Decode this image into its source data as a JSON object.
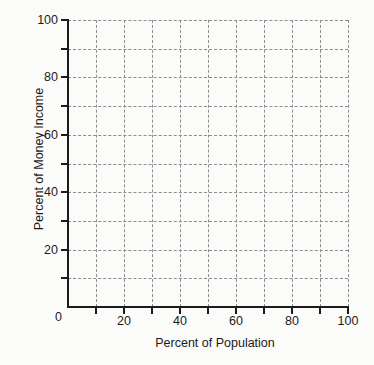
{
  "chart_data": {
    "type": "line",
    "title": "",
    "subtitle": "",
    "xlabel": "Percent of Population",
    "ylabel": "Percent of Money Income",
    "xlim": [
      0,
      100
    ],
    "ylim": [
      0,
      100
    ],
    "xticks": [
      0,
      10,
      20,
      30,
      40,
      50,
      60,
      70,
      80,
      90,
      100
    ],
    "yticks": [
      0,
      10,
      20,
      30,
      40,
      50,
      60,
      70,
      80,
      90,
      100
    ],
    "xticklabels": [
      "0",
      "",
      "20",
      "",
      "40",
      "",
      "60",
      "",
      "80",
      "",
      "100"
    ],
    "yticklabels": [
      "0",
      "",
      "20",
      "",
      "40",
      "",
      "60",
      "",
      "80",
      "",
      "100"
    ],
    "grid": true,
    "grid_style": "dashed",
    "grid_color": "#8d8d8d",
    "grid_spacing": 10,
    "legend": false,
    "legend_position": "none",
    "series": [],
    "values": [],
    "categories": [],
    "annotations": [],
    "note": "Empty plotting grid with no plotted data series."
  },
  "axes": {
    "origin_label": "0",
    "x": {
      "title": "Percent of Population",
      "labels": [
        {
          "value": 20,
          "text": "20"
        },
        {
          "value": 40,
          "text": "40"
        },
        {
          "value": 60,
          "text": "60"
        },
        {
          "value": 80,
          "text": "80"
        },
        {
          "value": 100,
          "text": "100"
        }
      ]
    },
    "y": {
      "title": "Percent of Money Income",
      "labels": [
        {
          "value": 20,
          "text": "20"
        },
        {
          "value": 40,
          "text": "40"
        },
        {
          "value": 60,
          "text": "60"
        },
        {
          "value": 80,
          "text": "80"
        },
        {
          "value": 100,
          "text": "100"
        }
      ]
    }
  },
  "colors": {
    "background": "#fbfbfa",
    "axis": "#1b1b1b",
    "grid": "#8d8d8d",
    "text": "#1b1b1b"
  }
}
